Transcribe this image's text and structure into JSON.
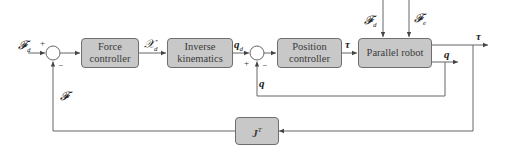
{
  "diagram": {
    "type": "control-block-diagram",
    "blocks": {
      "force_controller": {
        "line1": "Force",
        "line2": "controller"
      },
      "inverse_kinematics": {
        "line1": "Inverse",
        "line2": "kinematics"
      },
      "position_controller": {
        "line1": "Position",
        "line2": "controller"
      },
      "parallel_robot": {
        "label": "Parallel robot"
      },
      "jacobian_transpose": {
        "base": "J",
        "sup": "T"
      }
    },
    "signals": {
      "desired_force": {
        "base": "𝓕",
        "sub": "d"
      },
      "desired_pose": {
        "base": "𝒳",
        "sub": "d"
      },
      "desired_joints": {
        "base": "q",
        "sub": "d"
      },
      "torque_mid": "τ",
      "torque_out": "τ",
      "joints_out": "q",
      "joints_feedback": "q",
      "force_feedback": "𝓕",
      "disturbance_d": {
        "base": "𝓕",
        "sub": "d"
      },
      "disturbance_e": {
        "base": "𝓕",
        "sub": "e"
      }
    },
    "junctions": {
      "sum1": {
        "plus": "+",
        "minus": "−"
      },
      "sum2": {
        "plus": "+",
        "minus": "−"
      }
    },
    "colors": {
      "block_fill": "#c8c8c8",
      "block_border": "#6e6e6e",
      "line": "#555555"
    }
  }
}
